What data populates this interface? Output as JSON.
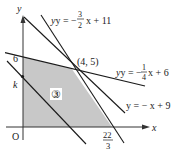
{
  "diagram": {
    "type": "linear-programming-region",
    "axes": {
      "x_label": "x",
      "y_label": "y",
      "origin_label": "O"
    },
    "tick_labels": {
      "y_intercept": "6",
      "y_k": "k",
      "x_intercept_num": "22",
      "x_intercept_den": "3"
    },
    "point": {
      "label": "(4, 5)",
      "x": 4,
      "y": 5
    },
    "region_label": "③",
    "lines": [
      {
        "id": "line1",
        "equation_prefix": "y = −",
        "frac_num": "3",
        "frac_den": "2",
        "equation_suffix": "x + 11",
        "slope": -1.5,
        "intercept": 11
      },
      {
        "id": "line2",
        "equation_prefix": "y = −",
        "frac_num": "1",
        "frac_den": "4",
        "equation_suffix": "x + 6",
        "slope": -0.25,
        "intercept": 6
      },
      {
        "id": "line3",
        "equation": "y = − x + 9",
        "slope": -1,
        "intercept": 9
      },
      {
        "id": "objective",
        "label": "k",
        "slope": -1
      }
    ],
    "colors": {
      "region_fill": "#c8c8c8",
      "line": "#1a1a1a",
      "axis": "#333333"
    }
  }
}
